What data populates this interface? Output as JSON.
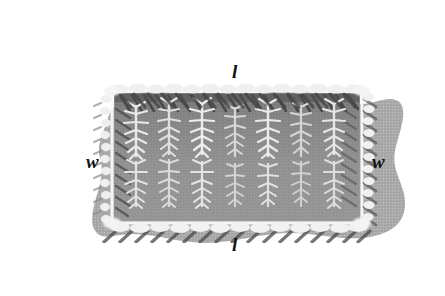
{
  "labels": {
    "length_top": "l",
    "length_bottom": "l",
    "width_left": "w",
    "width_right": "w"
  },
  "colors": {
    "lawn": "#a9a9a9",
    "lawn_dark": "#9a9a9a",
    "soil": "#8f8f8f",
    "soil_shadow": "#555555",
    "frame": "#f2f2f2",
    "plant_light": "#eeeeee",
    "plant_mid": "#c9c9c9",
    "label_text": "#111111",
    "page_background": "#ffffff"
  },
  "geometry": {
    "image_width": 445,
    "image_height": 296,
    "bed_left": 112,
    "bed_top": 91,
    "bed_width": 250,
    "bed_height": 132,
    "plant_columns": 7,
    "plant_rows": 2
  }
}
